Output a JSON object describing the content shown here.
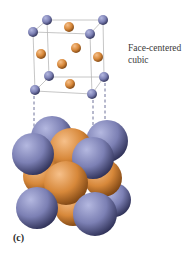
{
  "figure": {
    "title_line1": "Face-centered",
    "title_line2": "cubic",
    "panel_label": "(c)"
  },
  "colors": {
    "corner_atom": "#7c80b4",
    "face_atom": "#d7883a",
    "cell_edge": "#b8b8b8",
    "dashed_guide": "#4a4f80",
    "background": "#ffffff"
  },
  "unit_cell": {
    "corner_atoms": 8,
    "face_center_atoms": 6,
    "type": "face-centered cubic lattice"
  }
}
